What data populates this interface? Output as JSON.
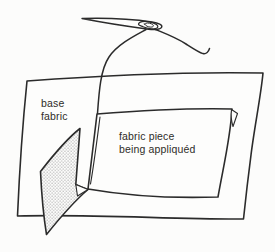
{
  "illustration": {
    "subject": "applique sewing technique diagram",
    "labels": {
      "base_fabric": {
        "line1": "base",
        "line2": "fabric"
      },
      "fabric_piece": {
        "line1": "fabric piece",
        "line2": "being appliquéd"
      }
    },
    "parts": [
      "needle",
      "thread",
      "base-fabric",
      "fabric-piece",
      "folded-back-corner"
    ],
    "colors": {
      "ink": "#2b2b2b",
      "paper": "#fcfcfb",
      "fabric_fill": "#fdfdfc",
      "stipple_dot": "#bdbdbd"
    }
  }
}
